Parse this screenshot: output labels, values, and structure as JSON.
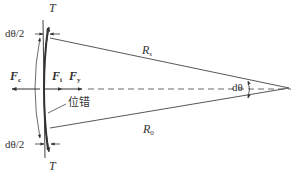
{
  "diagram": {
    "type": "force diagram of dislocation arc segment",
    "labels": {
      "tension_top": "T",
      "tension_bottom": "T",
      "half_angle_top": "dθ/2",
      "half_angle_bottom": "dθ/2",
      "force_left": {
        "main": "F",
        "sub": "c"
      },
      "force_middle": {
        "main": "F",
        "sub": "i"
      },
      "force_right": {
        "main": "F",
        "sub": "y"
      },
      "radius_top": {
        "main": "R",
        "sub": "s"
      },
      "radius_bottom": {
        "main": "R",
        "sub": "0"
      },
      "angle": "dθ",
      "dislocation": "位错"
    },
    "colors": {
      "line": "#444444",
      "text": "#333333",
      "background": "#ffffff"
    }
  }
}
